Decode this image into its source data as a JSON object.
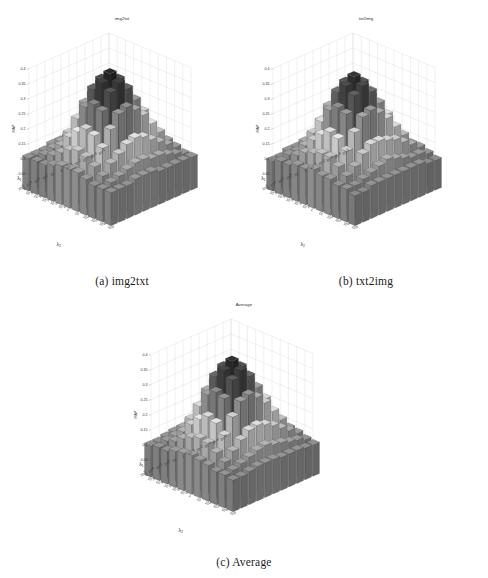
{
  "figure": {
    "panels": [
      {
        "id": "a",
        "caption": "(a) img2txt",
        "title": "img2txt"
      },
      {
        "id": "b",
        "caption": "(b) txt2img",
        "title": "txt2img"
      },
      {
        "id": "c",
        "caption": "(c) Average",
        "title": "Average"
      }
    ]
  },
  "chart_data": [
    {
      "type": "bar",
      "subtype": "bar3d-surface",
      "title": "img2txt",
      "xlabel": "λ₂",
      "ylabel": "λ₁",
      "zlabel": "MAP",
      "zlim": [
        0,
        0.4
      ],
      "zticks": [
        0,
        0.05,
        0.1,
        0.15,
        0.2,
        0.25,
        0.3,
        0.35,
        0.4
      ],
      "ztick_labels": [
        "0",
        "0.05",
        "0.1",
        "0.15",
        "0.2",
        "0.25",
        "0.3",
        "0.35",
        "0.4"
      ],
      "grid": true,
      "legend": null,
      "x_categories": [
        "10^-5",
        "10^-4",
        "10^-3",
        "10^-2",
        "10^-1",
        "1",
        "10",
        "10^2",
        "10^3",
        "10^4",
        "10^5"
      ],
      "y_categories": [
        "10^-5",
        "10^-4",
        "10^-3",
        "10^-2",
        "10^-1",
        "1",
        "10",
        "10^2",
        "10^3",
        "10^4",
        "10^5"
      ],
      "values": [
        [
          0.11,
          0.11,
          0.11,
          0.11,
          0.11,
          0.11,
          0.12,
          0.13,
          0.12,
          0.11,
          0.11
        ],
        [
          0.11,
          0.12,
          0.12,
          0.13,
          0.14,
          0.16,
          0.18,
          0.17,
          0.14,
          0.12,
          0.11
        ],
        [
          0.11,
          0.12,
          0.14,
          0.17,
          0.2,
          0.23,
          0.24,
          0.21,
          0.16,
          0.13,
          0.11
        ],
        [
          0.11,
          0.13,
          0.17,
          0.22,
          0.27,
          0.3,
          0.29,
          0.25,
          0.18,
          0.14,
          0.11
        ],
        [
          0.11,
          0.14,
          0.2,
          0.27,
          0.33,
          0.36,
          0.34,
          0.28,
          0.2,
          0.14,
          0.11
        ],
        [
          0.12,
          0.15,
          0.22,
          0.3,
          0.36,
          0.39,
          0.37,
          0.3,
          0.21,
          0.15,
          0.12
        ],
        [
          0.12,
          0.15,
          0.21,
          0.28,
          0.34,
          0.37,
          0.35,
          0.29,
          0.2,
          0.15,
          0.12
        ],
        [
          0.12,
          0.14,
          0.18,
          0.24,
          0.29,
          0.31,
          0.3,
          0.25,
          0.18,
          0.14,
          0.12
        ],
        [
          0.11,
          0.13,
          0.15,
          0.19,
          0.22,
          0.24,
          0.23,
          0.2,
          0.16,
          0.13,
          0.11
        ],
        [
          0.11,
          0.12,
          0.13,
          0.15,
          0.17,
          0.18,
          0.17,
          0.15,
          0.13,
          0.12,
          0.11
        ],
        [
          0.11,
          0.11,
          0.11,
          0.12,
          0.13,
          0.13,
          0.13,
          0.12,
          0.11,
          0.11,
          0.11
        ]
      ]
    },
    {
      "type": "bar",
      "subtype": "bar3d-surface",
      "title": "txt2img",
      "xlabel": "λ₂",
      "ylabel": "λ₁",
      "zlabel": "MAP",
      "zlim": [
        0,
        0.4
      ],
      "zticks": [
        0,
        0.05,
        0.1,
        0.15,
        0.2,
        0.25,
        0.3,
        0.35,
        0.4
      ],
      "ztick_labels": [
        "0",
        "0.05",
        "0.1",
        "0.15",
        "0.2",
        "0.25",
        "0.3",
        "0.35",
        "0.4"
      ],
      "grid": true,
      "legend": null,
      "x_categories": [
        "10^-5",
        "10^-4",
        "10^-3",
        "10^-2",
        "10^-1",
        "1",
        "10",
        "10^2",
        "10^3",
        "10^4",
        "10^5"
      ],
      "y_categories": [
        "10^-5",
        "10^-4",
        "10^-3",
        "10^-2",
        "10^-1",
        "1",
        "10",
        "10^2",
        "10^3",
        "10^4",
        "10^5"
      ],
      "values": [
        [
          0.1,
          0.1,
          0.11,
          0.11,
          0.11,
          0.11,
          0.12,
          0.12,
          0.12,
          0.11,
          0.1
        ],
        [
          0.1,
          0.11,
          0.12,
          0.13,
          0.14,
          0.15,
          0.17,
          0.16,
          0.14,
          0.12,
          0.1
        ],
        [
          0.11,
          0.12,
          0.14,
          0.16,
          0.19,
          0.22,
          0.23,
          0.2,
          0.16,
          0.12,
          0.11
        ],
        [
          0.11,
          0.13,
          0.16,
          0.21,
          0.26,
          0.29,
          0.28,
          0.24,
          0.18,
          0.13,
          0.11
        ],
        [
          0.11,
          0.14,
          0.19,
          0.26,
          0.32,
          0.35,
          0.33,
          0.27,
          0.19,
          0.14,
          0.11
        ],
        [
          0.11,
          0.15,
          0.21,
          0.29,
          0.35,
          0.38,
          0.36,
          0.29,
          0.2,
          0.15,
          0.11
        ],
        [
          0.11,
          0.15,
          0.21,
          0.27,
          0.33,
          0.36,
          0.34,
          0.28,
          0.2,
          0.14,
          0.11
        ],
        [
          0.11,
          0.14,
          0.18,
          0.23,
          0.28,
          0.3,
          0.29,
          0.24,
          0.18,
          0.13,
          0.11
        ],
        [
          0.11,
          0.12,
          0.15,
          0.18,
          0.21,
          0.23,
          0.22,
          0.19,
          0.15,
          0.12,
          0.11
        ],
        [
          0.1,
          0.12,
          0.13,
          0.15,
          0.16,
          0.17,
          0.17,
          0.15,
          0.13,
          0.11,
          0.1
        ],
        [
          0.1,
          0.11,
          0.11,
          0.12,
          0.12,
          0.13,
          0.12,
          0.12,
          0.11,
          0.11,
          0.1
        ]
      ]
    },
    {
      "type": "bar",
      "subtype": "bar3d-surface",
      "title": "Average",
      "xlabel": "λ₂",
      "ylabel": "λ₁",
      "zlabel": "MAP",
      "zlim": [
        0,
        0.4
      ],
      "zticks": [
        0,
        0.05,
        0.1,
        0.15,
        0.2,
        0.25,
        0.3,
        0.35,
        0.4
      ],
      "ztick_labels": [
        "0",
        "0.05",
        "0.1",
        "0.15",
        "0.2",
        "0.25",
        "0.3",
        "0.35",
        "0.4"
      ],
      "grid": true,
      "legend": null,
      "x_categories": [
        "10^-5",
        "10^-4",
        "10^-3",
        "10^-2",
        "10^-1",
        "1",
        "10",
        "10^2",
        "10^3",
        "10^4",
        "10^5"
      ],
      "y_categories": [
        "10^-5",
        "10^-4",
        "10^-3",
        "10^-2",
        "10^-1",
        "1",
        "10",
        "10^2",
        "10^3",
        "10^4",
        "10^5"
      ],
      "values": [
        [
          0.105,
          0.105,
          0.11,
          0.11,
          0.11,
          0.11,
          0.12,
          0.125,
          0.12,
          0.11,
          0.105
        ],
        [
          0.105,
          0.115,
          0.12,
          0.13,
          0.14,
          0.155,
          0.175,
          0.165,
          0.14,
          0.12,
          0.105
        ],
        [
          0.11,
          0.12,
          0.14,
          0.165,
          0.195,
          0.225,
          0.235,
          0.205,
          0.16,
          0.125,
          0.11
        ],
        [
          0.11,
          0.13,
          0.165,
          0.215,
          0.265,
          0.295,
          0.285,
          0.245,
          0.18,
          0.135,
          0.11
        ],
        [
          0.11,
          0.14,
          0.195,
          0.265,
          0.325,
          0.355,
          0.335,
          0.275,
          0.195,
          0.14,
          0.11
        ],
        [
          0.115,
          0.15,
          0.215,
          0.295,
          0.355,
          0.385,
          0.365,
          0.295,
          0.205,
          0.15,
          0.115
        ],
        [
          0.115,
          0.15,
          0.21,
          0.275,
          0.335,
          0.365,
          0.345,
          0.285,
          0.2,
          0.145,
          0.115
        ],
        [
          0.115,
          0.14,
          0.18,
          0.235,
          0.285,
          0.305,
          0.295,
          0.245,
          0.18,
          0.135,
          0.115
        ],
        [
          0.11,
          0.125,
          0.15,
          0.185,
          0.215,
          0.235,
          0.225,
          0.195,
          0.155,
          0.125,
          0.11
        ],
        [
          0.105,
          0.12,
          0.13,
          0.15,
          0.165,
          0.175,
          0.17,
          0.15,
          0.13,
          0.115,
          0.105
        ],
        [
          0.105,
          0.11,
          0.11,
          0.12,
          0.125,
          0.13,
          0.125,
          0.12,
          0.11,
          0.11,
          0.105
        ]
      ]
    }
  ]
}
